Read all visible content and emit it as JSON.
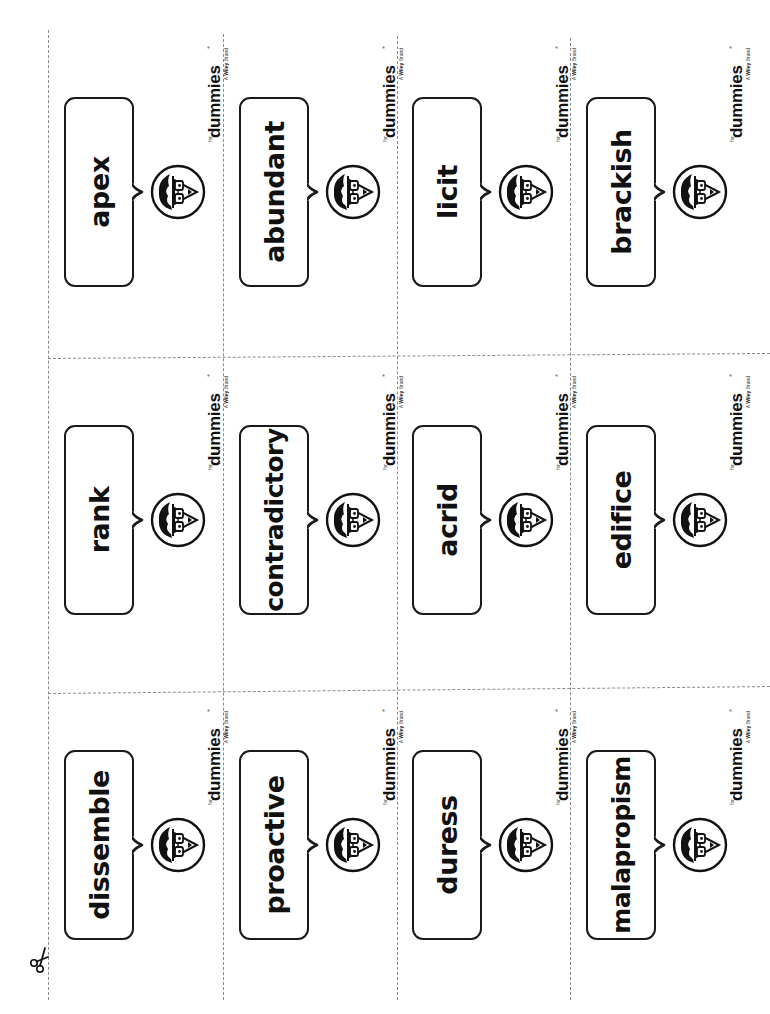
{
  "sheet": {
    "title": "Vocabulary flashcards",
    "orientation": "rotated-90-ccw",
    "cut_line_color": "#8a8a8a",
    "ink_color": "#111111",
    "scissors_icon": "scissors-icon"
  },
  "brand": {
    "for": "for",
    "name": "dummies",
    "registered": "®",
    "tagline_prefix": "A",
    "tagline_bold": "Wiley",
    "tagline_suffix": "Brand"
  },
  "grid": {
    "columns": 4,
    "rows": 3
  },
  "cards": [
    {
      "row": 0,
      "col": 0,
      "word": "apex"
    },
    {
      "row": 0,
      "col": 1,
      "word": "abundant"
    },
    {
      "row": 0,
      "col": 2,
      "word": "licit"
    },
    {
      "row": 0,
      "col": 3,
      "word": "brackish"
    },
    {
      "row": 1,
      "col": 0,
      "word": "rank"
    },
    {
      "row": 1,
      "col": 1,
      "word": "contradictory"
    },
    {
      "row": 1,
      "col": 2,
      "word": "acrid"
    },
    {
      "row": 1,
      "col": 3,
      "word": "edifice"
    },
    {
      "row": 2,
      "col": 0,
      "word": "dissemble"
    },
    {
      "row": 2,
      "col": 1,
      "word": "proactive"
    },
    {
      "row": 2,
      "col": 2,
      "word": "duress"
    },
    {
      "row": 2,
      "col": 3,
      "word": "malapropism"
    }
  ]
}
